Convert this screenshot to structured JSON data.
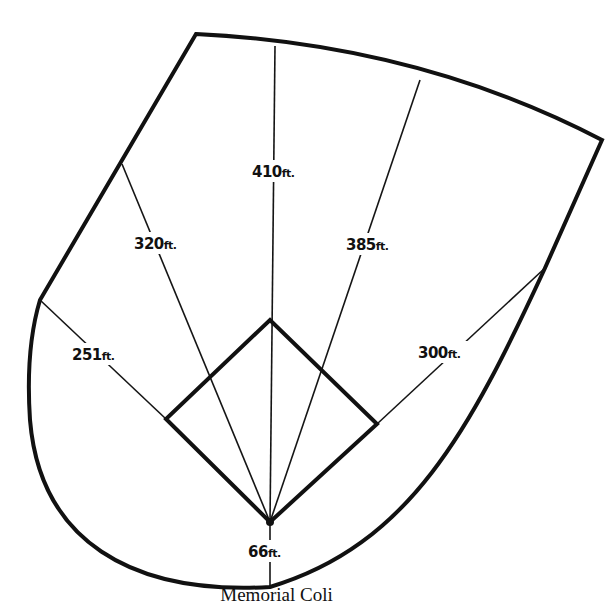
{
  "diagram": {
    "home_plate": {
      "x": 270,
      "y": 522
    },
    "distances": [
      {
        "id": "left-foul",
        "value": "251",
        "unit": "ft.",
        "end": [
          40,
          300
        ],
        "label_pos": [
          72,
          360
        ]
      },
      {
        "id": "left-center",
        "value": "320",
        "unit": "ft.",
        "end": [
          122,
          164
        ],
        "label_pos": [
          134,
          250
        ]
      },
      {
        "id": "center",
        "value": "410",
        "unit": "ft.",
        "end": [
          275,
          46
        ],
        "label_pos": [
          252,
          178
        ]
      },
      {
        "id": "right-center",
        "value": "385",
        "unit": "ft.",
        "end": [
          420,
          80
        ],
        "label_pos": [
          346,
          251
        ]
      },
      {
        "id": "right-foul",
        "value": "300",
        "unit": "ft.",
        "end": [
          545,
          268
        ],
        "label_pos": [
          418,
          359
        ]
      },
      {
        "id": "backstop",
        "value": "66",
        "unit": "ft.",
        "end": [
          270,
          587
        ],
        "label_pos": [
          248,
          558
        ]
      }
    ],
    "infield_diamond": {
      "home": [
        270,
        522
      ],
      "first_base": [
        377,
        424
      ],
      "second_base": [
        270,
        320
      ],
      "third_base": [
        166,
        419
      ]
    }
  },
  "caption": {
    "text": "Memorial Coli"
  }
}
